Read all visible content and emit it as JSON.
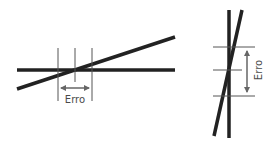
{
  "diagram": {
    "left_figure": {
      "label": "Erro",
      "description": "shallow-angle intersection: large error along horizontal"
    },
    "right_figure": {
      "label": "Erro",
      "description": "steep-angle intersection: large error along vertical"
    },
    "colors": {
      "thick_line": "#222222",
      "thin_line": "#555555",
      "arrow": "#666666",
      "text": "#4a4a4a"
    }
  }
}
